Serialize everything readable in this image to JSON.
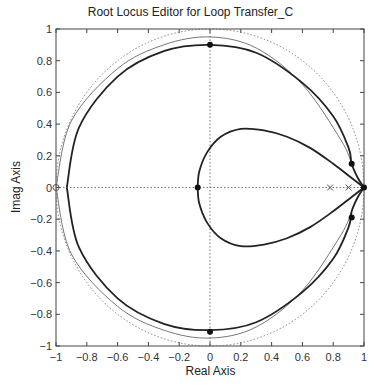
{
  "chart_data": {
    "type": "line",
    "title": "Root Locus Editor for Loop Transfer_C",
    "xlabel": "Real Axis",
    "ylabel": "Imag Axis",
    "xlim": [
      -1,
      1
    ],
    "ylim": [
      -1,
      1
    ],
    "grid": false,
    "xticks": [
      "−1",
      "−0.8",
      "−0.6",
      "−0.4",
      "−0.2",
      "0",
      "0.2",
      "0.4",
      "0.6",
      "0.8",
      "1"
    ],
    "yticks": [
      "1",
      "0.8",
      "0.6",
      "0.4",
      "0.2",
      "0",
      "−0.2",
      "−0.4",
      "−0.6",
      "−0.8",
      "−1"
    ],
    "series": [
      {
        "name": "unit-circle",
        "style": "dotted",
        "shape": "circle",
        "center": [
          0,
          0
        ],
        "radius": 1
      },
      {
        "name": "thin-locus-branch",
        "style": "thin-solid",
        "points": [
          [
            -1,
            0
          ],
          [
            -0.9,
            0.42
          ],
          [
            -0.6,
            0.75
          ],
          [
            -0.3,
            0.9
          ],
          [
            0,
            0.95
          ],
          [
            0.3,
            0.88
          ],
          [
            0.6,
            0.65
          ],
          [
            0.85,
            0.3
          ],
          [
            0.92,
            0.15
          ]
        ]
      },
      {
        "name": "outer-locus-branch",
        "style": "thick-solid",
        "points": [
          [
            -0.93,
            0
          ],
          [
            -0.85,
            0.38
          ],
          [
            -0.6,
            0.7
          ],
          [
            -0.3,
            0.86
          ],
          [
            0,
            0.9
          ],
          [
            0.3,
            0.85
          ],
          [
            0.6,
            0.66
          ],
          [
            0.8,
            0.45
          ],
          [
            0.9,
            0.25
          ],
          [
            0.92,
            0.15
          ],
          [
            0.96,
            0.06
          ],
          [
            1,
            0
          ]
        ]
      },
      {
        "name": "inner-loop-branch",
        "style": "thick-solid",
        "points": [
          [
            -0.08,
            0
          ],
          [
            -0.07,
            0.1
          ],
          [
            -0.02,
            0.22
          ],
          [
            0.07,
            0.32
          ],
          [
            0.2,
            0.37
          ],
          [
            0.35,
            0.36
          ],
          [
            0.5,
            0.32
          ],
          [
            0.65,
            0.25
          ],
          [
            0.8,
            0.15
          ],
          [
            0.92,
            0.06
          ],
          [
            1,
            0
          ]
        ]
      }
    ],
    "markers": {
      "closed_loop_poles": [
        [
          0,
          0.9
        ],
        [
          0,
          -0.91
        ],
        [
          -0.08,
          0
        ],
        [
          0.92,
          0.15
        ],
        [
          0.92,
          -0.19
        ],
        [
          1,
          0
        ]
      ],
      "open_loop_poles_x": [
        [
          0.78,
          0
        ],
        [
          0.9,
          0
        ]
      ],
      "open_loop_zeros_o": [
        [
          -1,
          0
        ]
      ]
    }
  }
}
